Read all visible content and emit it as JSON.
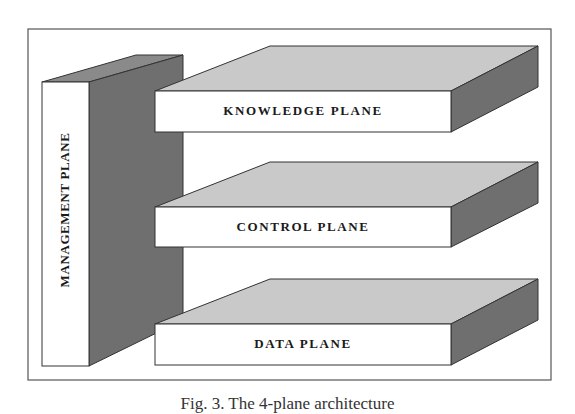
{
  "figure": {
    "caption": "Fig. 3. The 4-plane architecture",
    "colors": {
      "front_face": "#ffffff",
      "top_face": "#c9c9c9",
      "side_face": "#6f6f6f",
      "outline": "#333333",
      "frame": "#555555"
    },
    "management_plane": {
      "label": "MANAGEMENT PLANE"
    },
    "planes": [
      {
        "label": "KNOWLEDGE PLANE"
      },
      {
        "label": "CONTROL PLANE"
      },
      {
        "label": "DATA PLANE"
      }
    ]
  }
}
